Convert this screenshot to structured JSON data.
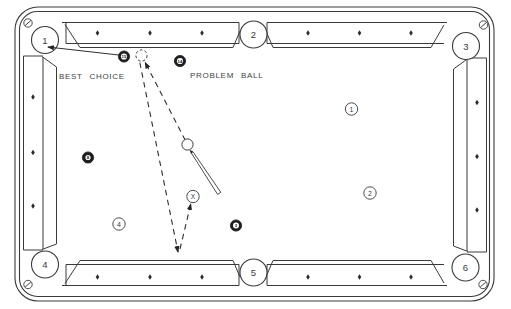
{
  "diagram": {
    "type": "billiards-instruction-diagram",
    "labels": {
      "best_choice": "BEST CHOICE",
      "problem_ball": "PROBLEM BALL"
    },
    "pockets": [
      {
        "number": "1"
      },
      {
        "number": "2"
      },
      {
        "number": "3"
      },
      {
        "number": "4"
      },
      {
        "number": "5"
      },
      {
        "number": "6"
      }
    ],
    "position_markers": [
      {
        "label": "1"
      },
      {
        "label": "2"
      },
      {
        "label": "4"
      }
    ],
    "target_marker": {
      "label": "X"
    },
    "balls": {
      "object_ball": {
        "number": "15"
      },
      "problem_ball": {
        "number": "14"
      },
      "eight_ball": {
        "number": "8"
      },
      "other_ball": {
        "number": "3"
      }
    },
    "colors": {
      "line": "#3a3a3a",
      "ball_fill": "#1e1e1e",
      "background": "#ffffff"
    }
  }
}
